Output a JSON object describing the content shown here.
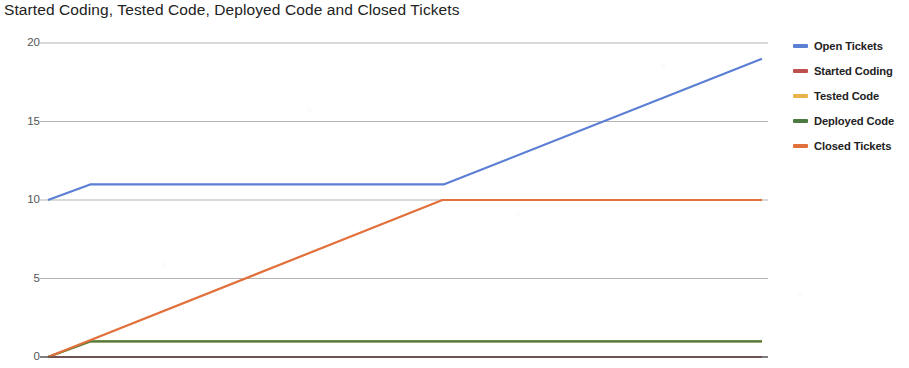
{
  "chart_data": {
    "type": "line",
    "title": "Started Coding, Tested Code, Deployed Code and Closed Tickets",
    "xlabel": "",
    "ylabel": "",
    "ylim": [
      0,
      20
    ],
    "xlim": [
      0,
      20
    ],
    "grid": true,
    "grid_axis": "y",
    "legend_position": "right",
    "y_ticks": [
      0,
      5,
      10,
      15,
      20
    ],
    "y_tick_labels": [
      "0",
      "5",
      "10",
      "15",
      "20"
    ],
    "x_tick_labels": [],
    "series": [
      {
        "name": "Open Tickets",
        "color": "#5b7fd4",
        "x": [
          0,
          1.2,
          11.1,
          20
        ],
        "values": [
          10,
          11,
          11,
          19
        ]
      },
      {
        "name": "Started Coding",
        "color": "#c0504d",
        "x": [
          0,
          20
        ],
        "values": [
          0,
          0
        ]
      },
      {
        "name": "Tested Code",
        "color": "#e8b44a",
        "x": [
          0,
          1.2,
          20
        ],
        "values": [
          0,
          1,
          1
        ]
      },
      {
        "name": "Deployed Code",
        "color": "#4c7a3f",
        "x": [
          0,
          1.2,
          20
        ],
        "values": [
          0,
          1,
          1
        ]
      },
      {
        "name": "Closed Tickets",
        "color": "#e2703a",
        "x": [
          0,
          11.05,
          20
        ],
        "values": [
          0,
          10,
          10
        ]
      }
    ]
  },
  "legend": {
    "items": [
      {
        "label": "Open Tickets",
        "color": "#5b7fd4"
      },
      {
        "label": "Started Coding",
        "color": "#c0504d"
      },
      {
        "label": "Tested Code",
        "color": "#e8b44a"
      },
      {
        "label": "Deployed Code",
        "color": "#4c7a3f"
      },
      {
        "label": "Closed Tickets",
        "color": "#e2703a"
      }
    ]
  },
  "axis_colors": {
    "gridline": "#b4b4b4",
    "baseline": "#555555",
    "tick_text": "#555555"
  }
}
